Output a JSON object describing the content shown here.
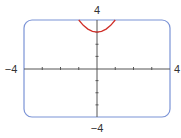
{
  "chart_data": {
    "type": "line",
    "title": "",
    "xlabel": "",
    "ylabel": "",
    "xlim": [
      -4,
      4
    ],
    "ylim": [
      -4,
      4
    ],
    "grid": false,
    "tick_labels": {
      "x_min": "−4",
      "x_max": "4",
      "y_min": "−4",
      "y_max": "4"
    },
    "series": [
      {
        "name": "y = x^2 + 3",
        "color": "#d0302a",
        "x": [
          -1,
          -0.75,
          -0.5,
          -0.25,
          0,
          0.25,
          0.5,
          0.75,
          1
        ],
        "y": [
          4,
          3.5625,
          3.25,
          3.0625,
          3,
          3.0625,
          3.25,
          3.5625,
          4
        ]
      }
    ]
  },
  "colors": {
    "frame": "#7b93d6",
    "axis": "#555555",
    "curve": "#d0302a"
  }
}
